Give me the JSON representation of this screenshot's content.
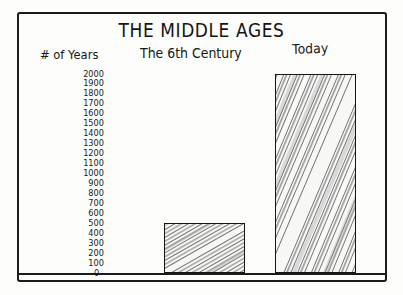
{
  "title": "THE MIDDLE AGES",
  "axis_title": "# of Years",
  "headers": {
    "century": "The 6th Century",
    "today": "Today"
  },
  "zero_label": "--0--",
  "colors": {
    "ink": "#151515",
    "paper": "#fdfdfc",
    "pencil": "#555555"
  },
  "chart_data": {
    "type": "bar",
    "title": "THE MIDDLE AGES",
    "xlabel": "",
    "ylabel": "# of Years",
    "categories": [
      "The 6th Century",
      "Today"
    ],
    "values": [
      500,
      2000
    ],
    "ylim": [
      0,
      2000
    ],
    "yticks": [
      2000,
      1900,
      1800,
      1700,
      1600,
      1500,
      1400,
      1300,
      1200,
      1100,
      1000,
      900,
      800,
      700,
      600,
      500,
      400,
      300,
      200,
      100,
      0
    ],
    "ytick_labels": [
      "2000",
      "1900",
      "1800",
      "1700",
      "1600",
      "1500",
      "1400",
      "1300",
      "1200",
      "1100",
      "1000",
      "900",
      "800",
      "700",
      "600",
      "500",
      "400",
      "300",
      "200",
      "100",
      "--0--"
    ],
    "grid": false,
    "legend": false,
    "style": "hand-drawn-pencil-sketch"
  }
}
